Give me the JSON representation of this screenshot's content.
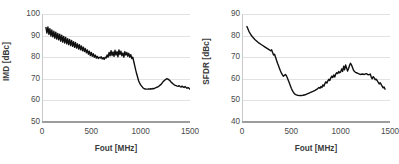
{
  "figure": {
    "background_color": "#ffffff",
    "grid_color": "#e2e2e2",
    "line_color": "#101010",
    "text_color": "#4a4a4a"
  },
  "chart_data": [
    {
      "type": "line",
      "id": "imd-vs-fout",
      "title": "",
      "xlabel": "Fout [MHz]",
      "ylabel": "IMD [dBc]",
      "xlim": [
        0,
        1500
      ],
      "ylim": [
        50,
        100
      ],
      "xticks": [
        0,
        500,
        1000,
        1500
      ],
      "xtick_labels": [
        "0",
        "500",
        "1000",
        "1500"
      ],
      "yticks": [
        50,
        60,
        70,
        80,
        90,
        100
      ],
      "ytick_labels": [
        "50",
        "60",
        "70",
        "80",
        "90",
        "100"
      ],
      "grid": "horizontal",
      "legend": "none",
      "series": [
        {
          "name": "IMD",
          "x": [
            40,
            50,
            60,
            70,
            80,
            90,
            100,
            110,
            120,
            130,
            140,
            150,
            160,
            170,
            180,
            190,
            200,
            210,
            220,
            230,
            240,
            250,
            260,
            270,
            280,
            290,
            300,
            310,
            320,
            330,
            340,
            350,
            360,
            370,
            380,
            390,
            400,
            410,
            420,
            430,
            440,
            450,
            460,
            470,
            480,
            490,
            500,
            510,
            520,
            530,
            540,
            550,
            560,
            570,
            580,
            590,
            600,
            610,
            620,
            630,
            640,
            650,
            660,
            670,
            680,
            690,
            700,
            710,
            720,
            730,
            740,
            750,
            760,
            770,
            780,
            790,
            800,
            810,
            820,
            830,
            840,
            850,
            860,
            870,
            880,
            890,
            900,
            910,
            920,
            930,
            940,
            950,
            960,
            970,
            980,
            990,
            1000,
            1010,
            1020,
            1030,
            1040,
            1050,
            1060,
            1070,
            1080,
            1090,
            1100,
            1110,
            1120,
            1130,
            1140,
            1150,
            1160,
            1170,
            1180,
            1190,
            1200,
            1210,
            1220,
            1230,
            1240,
            1250,
            1260,
            1270,
            1280,
            1290,
            1300,
            1310,
            1320,
            1330,
            1340,
            1350,
            1360,
            1370,
            1380,
            1390,
            1400,
            1410,
            1420,
            1430,
            1440,
            1450,
            1460,
            1470,
            1480,
            1490,
            1500
          ],
          "y": [
            93.8,
            91.2,
            94.0,
            90.6,
            93.2,
            89.8,
            92.6,
            89.4,
            92.0,
            88.8,
            91.6,
            88.4,
            91.0,
            88.0,
            90.6,
            87.4,
            90.2,
            87.0,
            89.6,
            86.6,
            89.2,
            86.2,
            88.6,
            85.8,
            88.2,
            85.4,
            87.8,
            85.0,
            87.2,
            84.6,
            86.8,
            84.2,
            86.2,
            83.8,
            85.8,
            83.4,
            85.2,
            83.0,
            84.6,
            82.6,
            84.0,
            82.0,
            83.4,
            81.4,
            82.8,
            80.8,
            82.2,
            80.4,
            81.6,
            80.0,
            81.0,
            79.6,
            80.4,
            79.4,
            80.0,
            79.6,
            80.2,
            79.2,
            79.8,
            79.0,
            80.0,
            79.6,
            81.0,
            80.0,
            82.2,
            80.6,
            83.0,
            80.8,
            82.4,
            80.4,
            83.2,
            81.0,
            82.6,
            80.2,
            83.4,
            81.2,
            82.8,
            80.6,
            82.0,
            80.0,
            82.6,
            81.0,
            82.2,
            80.4,
            81.8,
            80.0,
            81.2,
            79.4,
            80.0,
            78.0,
            76.0,
            74.0,
            72.2,
            70.6,
            69.0,
            68.0,
            67.2,
            66.6,
            66.0,
            65.6,
            65.4,
            65.2,
            65.2,
            65.2,
            65.3,
            65.2,
            65.4,
            65.3,
            65.5,
            65.4,
            65.6,
            65.8,
            66.0,
            66.2,
            66.4,
            66.8,
            67.2,
            67.6,
            68.2,
            68.8,
            69.2,
            69.6,
            69.9,
            70.0,
            69.8,
            69.4,
            69.0,
            68.4,
            68.0,
            67.6,
            67.2,
            67.0,
            66.8,
            66.6,
            66.5,
            66.8,
            66.4,
            66.2,
            66.6,
            66.2,
            66.0,
            66.4,
            66.0,
            65.6,
            66.0,
            65.6,
            65.2,
            65.6,
            65.2,
            65.0,
            65.4,
            65.0,
            64.8,
            65.2,
            64.8,
            64.6,
            65.0,
            64.6,
            64.4,
            64.8
          ]
        }
      ]
    },
    {
      "type": "line",
      "id": "sfdr-vs-fout",
      "title": "",
      "xlabel": "Fout [MHz]",
      "ylabel": "SFDR [dBc]",
      "xlim": [
        0,
        1500
      ],
      "ylim": [
        40,
        90
      ],
      "xticks": [
        0,
        500,
        1000,
        1500
      ],
      "xtick_labels": [
        "0",
        "500",
        "1000",
        "1500"
      ],
      "yticks": [
        40,
        50,
        60,
        70,
        80,
        90
      ],
      "ytick_labels": [
        "40",
        "50",
        "60",
        "70",
        "80",
        "90"
      ],
      "grid": "horizontal",
      "legend": "none",
      "series": [
        {
          "name": "SFDR",
          "x": [
            50,
            70,
            90,
            110,
            130,
            150,
            170,
            190,
            210,
            230,
            250,
            270,
            290,
            300,
            310,
            320,
            330,
            340,
            350,
            360,
            370,
            380,
            390,
            400,
            410,
            420,
            430,
            440,
            450,
            460,
            470,
            480,
            490,
            500,
            510,
            520,
            530,
            540,
            550,
            560,
            570,
            580,
            590,
            600,
            620,
            640,
            660,
            680,
            700,
            720,
            740,
            760,
            780,
            790,
            800,
            810,
            820,
            830,
            840,
            850,
            860,
            870,
            880,
            890,
            900,
            910,
            920,
            930,
            940,
            950,
            960,
            970,
            980,
            990,
            1000,
            1010,
            1020,
            1030,
            1040,
            1050,
            1060,
            1070,
            1080,
            1090,
            1100,
            1110,
            1120,
            1130,
            1140,
            1150,
            1160,
            1170,
            1180,
            1190,
            1200,
            1220,
            1240,
            1260,
            1280,
            1300,
            1310,
            1320,
            1330,
            1340,
            1350,
            1360,
            1370,
            1380,
            1390,
            1400,
            1410,
            1420,
            1430,
            1440,
            1450
          ],
          "y": [
            84.2,
            82.0,
            80.4,
            79.2,
            78.2,
            77.4,
            76.6,
            76.0,
            75.4,
            74.8,
            74.2,
            73.6,
            73.0,
            73.4,
            72.2,
            71.0,
            71.4,
            70.0,
            68.6,
            67.2,
            66.0,
            64.8,
            63.6,
            62.6,
            61.8,
            61.2,
            61.6,
            62.0,
            61.4,
            60.4,
            59.2,
            58.0,
            56.8,
            55.6,
            54.6,
            53.8,
            53.2,
            52.8,
            52.6,
            52.4,
            52.3,
            52.2,
            52.3,
            52.2,
            52.4,
            52.6,
            53.0,
            53.4,
            53.8,
            54.2,
            54.6,
            55.2,
            56.0,
            55.6,
            56.4,
            56.0,
            57.2,
            56.6,
            57.8,
            58.6,
            58.0,
            59.0,
            59.8,
            59.2,
            60.4,
            61.2,
            60.6,
            61.8,
            60.8,
            62.2,
            62.8,
            62.4,
            63.4,
            62.8,
            63.2,
            64.6,
            63.4,
            65.8,
            64.2,
            66.4,
            65.0,
            63.6,
            64.8,
            66.2,
            67.2,
            66.4,
            65.2,
            64.0,
            63.4,
            63.0,
            62.8,
            62.6,
            62.4,
            62.2,
            62.0,
            62.2,
            62.0,
            62.4,
            61.8,
            62.2,
            60.8,
            60.0,
            61.0,
            60.4,
            59.6,
            59.8,
            59.2,
            58.4,
            57.6,
            58.2,
            57.4,
            56.6,
            55.8,
            56.2,
            55.2
          ]
        }
      ]
    }
  ]
}
